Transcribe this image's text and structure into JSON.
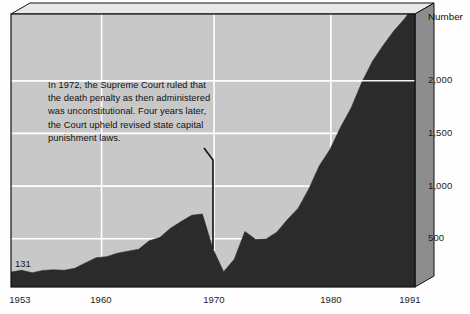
{
  "chart_data": {
    "type": "area",
    "title": "",
    "subtitle": "",
    "xlabel": "",
    "ylabel": "Number",
    "xlim": [
      1953,
      1991
    ],
    "ylim": [
      0,
      2400
    ],
    "grid": true,
    "legend": "none",
    "x_ticks": [
      "1953",
      "1960",
      "1970",
      "1980",
      "1991"
    ],
    "x_tick_values": [
      1953,
      1960,
      1970,
      1980,
      1991
    ],
    "y_ticks": [
      "500",
      "1,000",
      "1,500",
      "2,000"
    ],
    "y_tick_values": [
      500,
      1000,
      1500,
      2000
    ],
    "series_name": "Prisoners under sentence of death",
    "x": [
      1953,
      1954,
      1955,
      1956,
      1957,
      1958,
      1959,
      1960,
      1961,
      1962,
      1963,
      1964,
      1965,
      1966,
      1967,
      1968,
      1969,
      1970,
      1971,
      1972,
      1973,
      1974,
      1975,
      1976,
      1977,
      1978,
      1979,
      1980,
      1981,
      1982,
      1983,
      1984,
      1985,
      1986,
      1987,
      1988,
      1989,
      1990,
      1991
    ],
    "values": [
      131,
      147,
      125,
      146,
      151,
      147,
      164,
      212,
      257,
      267,
      297,
      315,
      331,
      406,
      435,
      517,
      575,
      631,
      642,
      334,
      134,
      244,
      488,
      420,
      423,
      482,
      593,
      691,
      860,
      1066,
      1209,
      1405,
      1575,
      1800,
      1984,
      2124,
      2250,
      2356,
      2482
    ],
    "annotation": {
      "lines": [
        "In 1972, the Supreme Court ruled that",
        "the death penalty as then administered",
        "was unconstitutional.  Four years later,",
        "the Court upheld revised state capital",
        "punishment laws."
      ],
      "pointer_target_year": 1972
    },
    "first_value_label": "131",
    "colors": {
      "plot_background": "#c8c8c8",
      "area_fill": "#2a2a2a",
      "gridline": "#ffffff",
      "frame": "#111111",
      "bevel_top": "#e2e2e2",
      "bevel_side": "#8e8e8e",
      "text": "#111111"
    }
  }
}
